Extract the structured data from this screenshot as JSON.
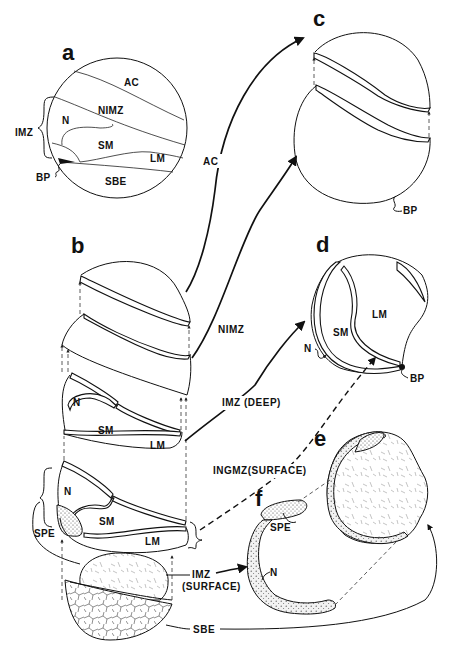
{
  "figure": {
    "panels": {
      "a": {
        "label": "a",
        "regions": {
          "ac": "AC",
          "nimz": "NIMZ",
          "n": "N",
          "sm": "SM",
          "lm": "LM",
          "sbe": "SBE"
        },
        "bracket_label": "IMZ",
        "bp_label": "BP"
      },
      "b": {
        "label": "b",
        "upper_n": "N",
        "upper_sm": "SM",
        "upper_lm": "LM",
        "lower_n": "N",
        "lower_sm": "SM",
        "lower_lm": "LM",
        "spe": "SPE"
      },
      "c": {
        "label": "c",
        "bp_label": "BP"
      },
      "d": {
        "label": "d",
        "lm": "LM",
        "sm": "SM",
        "n": "N",
        "bp_label": "BP"
      },
      "e": {
        "label": "e"
      },
      "f": {
        "label": "f",
        "spe": "SPE",
        "n": "N"
      }
    },
    "arrows": {
      "ac": "AC",
      "nimz": "NIMZ",
      "imz_deep": "IMZ (DEEP)",
      "ingmz_surface": "INGMZ(SURFACE)",
      "imz_surface_line1": "IMZ",
      "imz_surface_line2": "(SURFACE)",
      "sbe": "SBE"
    }
  }
}
